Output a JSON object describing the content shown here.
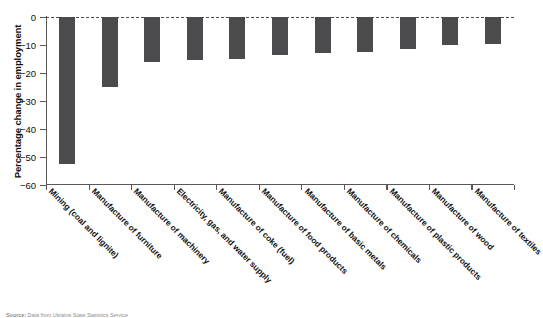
{
  "chart_data": {
    "type": "bar",
    "title": "",
    "subtitle": "",
    "xlabel": "",
    "ylabel": "Percentage change in employment",
    "ylim": [
      -60,
      0
    ],
    "ytick_labels": [
      "0",
      "−10",
      "−20",
      "−30",
      "−40",
      "−50",
      "−60"
    ],
    "ytick_values": [
      0,
      -10,
      -20,
      -30,
      -40,
      -50,
      -60
    ],
    "grid": false,
    "legend": null,
    "zero_reference_line": true,
    "bar_color": "#4b4b4d",
    "axis_color": "#59595b",
    "categories": [
      "Mining (coal and lignite)",
      "Manufacture of furniture",
      "Manufacture of machinery",
      "Electricity, gas, and water supply",
      "Manufacture of coke (fuel)",
      "Manufacture of food products",
      "Manufacture of basic metals",
      "Manufacture of chemicals",
      "Manufacture of plastic products",
      "Manufacture of wood",
      "Manufacture of textiles"
    ],
    "values": [
      -52.5,
      -25,
      -16,
      -15.5,
      -15,
      -13.5,
      -13,
      -12.5,
      -11.5,
      -10,
      -9.5
    ]
  },
  "caption": {
    "source_lead": "Source:",
    "source_text": "Data from Ukraine State Statistics Service"
  }
}
